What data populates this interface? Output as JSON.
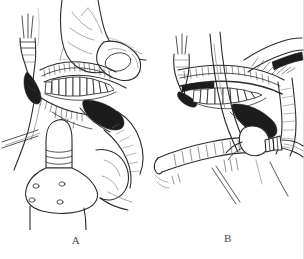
{
  "figure": {
    "type": "surgical-line-illustration",
    "style": "pen-and-ink medical illustration, black line art on white",
    "background_color": "#ffffff",
    "ink_color": "#2b2b2b",
    "faint_ink_color": "#8d8d8d",
    "shadow_fill": "#1c1c1c",
    "panel_count": 2
  },
  "panels": [
    {
      "id": "A",
      "caption": "A",
      "description": "Operator's gloved hand retracting the lower lip and cheek to expose the mandibular alveolar ridge and teeth; a cylindrical flanged guide/implant-stop instrument is held against the chin below, with a retractor entering from the left.",
      "elements": [
        "retracting-hand",
        "index-finger",
        "thumb",
        "lower-lip",
        "mandibular-teeth",
        "alveolar-ridge",
        "gingival-tissue",
        "surgical-retractor",
        "cylindrical-guide-instrument",
        "flanged-base-plate",
        "incision-line",
        "shadowed-oral-cavity"
      ]
    },
    {
      "id": "B",
      "caption": "B",
      "description": "Same operative field with the lip retracted downward by a flat retractor; a straight surgical handpiece/drill with a burr is advanced toward the anterior mandible, a second retractor blade passes vertically across the field.",
      "elements": [
        "vertical-retractor-blade",
        "flat-lip-retractor",
        "mandibular-teeth",
        "gingival-margin",
        "alveolar-bone",
        "surgical-handpiece",
        "drill-burr",
        "instrument-shaft",
        "shadowed-oral-cavity",
        "tissue-hatching"
      ]
    }
  ],
  "captions": {
    "panel_a_label": "A",
    "panel_b_label": "B"
  }
}
